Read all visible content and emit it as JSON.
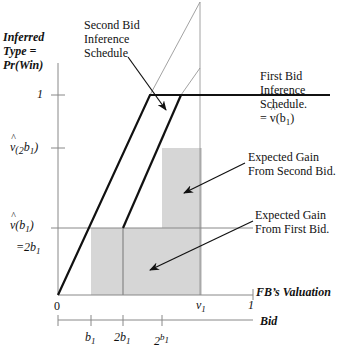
{
  "diagram": {
    "type": "economic-inference-schedule",
    "y_axis_label": [
      "Inferred",
      "Type =",
      "Pr(Win)"
    ],
    "x_axis_label": "FB's Valuation",
    "bid_axis_label": "Bid",
    "y_ticks": [
      {
        "label": "1",
        "y": 95
      },
      {
        "label": "v̂(2b₁)",
        "y": 148
      },
      {
        "label": "v̂(b₁)",
        "sub": "=2b₁",
        "y": 228
      }
    ],
    "x_ticks": [
      {
        "label": "0"
      },
      {
        "label": "v₁"
      },
      {
        "label": "1"
      }
    ],
    "bid_ticks": [
      {
        "label": "b₁"
      },
      {
        "label": "2b₁"
      },
      {
        "label": "2b₁ (squared)"
      }
    ],
    "annotations": {
      "second_bid": [
        "Second Bid",
        "Inference",
        "Schedule"
      ],
      "first_bid": [
        "First Bid",
        "Inference",
        "Schedule.",
        "= v̂(b₁)"
      ],
      "gain_second": [
        "Expected Gain",
        "From Second Bid."
      ],
      "gain_first": [
        "Expected Gain",
        "From First Bid."
      ]
    },
    "colors": {
      "shade": "#d6d6d6",
      "thick_line": "#111111",
      "thin_line": "#8a8a8a"
    }
  },
  "labels": {
    "y1": "Inferred",
    "y2": "Type =",
    "y3": "Pr(Win)",
    "tick_one": "1",
    "tick_v2b": "(",
    "tick_vb": "(",
    "eq2b": "=2",
    "origin": "0",
    "v1": "v",
    "x_one": "1",
    "fb_val": "FB’s Valuation",
    "bid": "Bid",
    "b1": "b",
    "two_b1": "2b",
    "two": "2",
    "sb1": "Second Bid",
    "sb2": "Inference",
    "sb3": "Schedule",
    "fb1": "First Bid",
    "fb2": "Inference",
    "fb3": "Schedule.",
    "fb4": "= ",
    "g2a": "Expected Gain",
    "g2b": "From Second Bid.",
    "g1a": "Expected Gain",
    "g1b": "From First Bid.",
    "sub1": "1",
    "vhat": "v",
    "b_char": "b",
    "close": ")",
    "fb4b": "(b",
    "fb4c": ")"
  }
}
